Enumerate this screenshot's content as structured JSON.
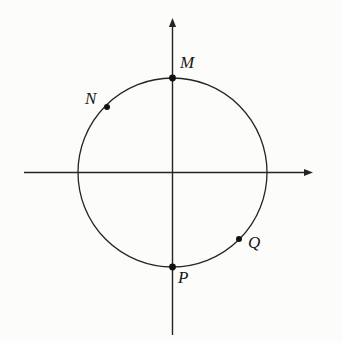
{
  "figure": {
    "kind": "unit-circle-diagram",
    "background_color": "#fcfcfb",
    "stroke_color": "#242424",
    "point_color": "#111111",
    "label_color": "#171717",
    "canvas": {
      "width": 343,
      "height": 343
    },
    "geometry": {
      "origin": {
        "x": 172.5,
        "y": 172.5
      },
      "circle": {
        "cx": 172.5,
        "cy": 172.5,
        "r": 94.5,
        "stroke_width": 1.3
      },
      "x_axis": {
        "x1": 24,
        "y1": 172.5,
        "x2": 313,
        "y2": 172.5,
        "arrow": "right",
        "stroke_width": 1.4
      },
      "y_axis": {
        "x1": 172.5,
        "y1": 335,
        "x2": 172.5,
        "y2": 18,
        "arrow": "up",
        "stroke_width": 1.4
      }
    },
    "points": [
      {
        "id": "M",
        "label": "M",
        "x": 172.5,
        "y": 78,
        "angle_deg": 90,
        "dot_r": 3.4,
        "label_x": 180,
        "label_y": 54
      },
      {
        "id": "N",
        "label": "N",
        "x": 107,
        "y": 107,
        "angle_deg": 135,
        "dot_r": 3.0,
        "label_x": 85,
        "label_y": 90
      },
      {
        "id": "P",
        "label": "P",
        "x": 172.5,
        "y": 267,
        "angle_deg": 270,
        "dot_r": 3.4,
        "label_x": 178,
        "label_y": 269
      },
      {
        "id": "Q",
        "label": "Q",
        "x": 239,
        "y": 239,
        "angle_deg": 315,
        "dot_r": 3.0,
        "label_x": 248,
        "label_y": 234
      }
    ]
  }
}
